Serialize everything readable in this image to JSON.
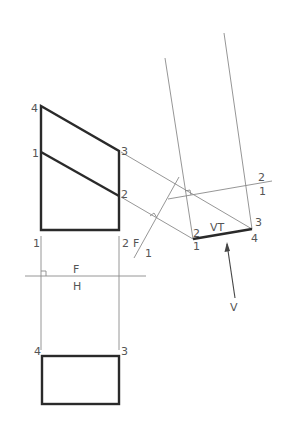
{
  "figure": {
    "type": "descriptive-geometry auxiliary view",
    "colors": {
      "object_line": "#2a2a2a",
      "construction_line": "#8a8a8a",
      "label": "#555555"
    }
  },
  "front_view": {
    "points": {
      "4": "4",
      "3": "3",
      "1": "1",
      "2": "2"
    },
    "bottom_labels": {
      "left": "1",
      "right": "2"
    }
  },
  "fold_lines": {
    "fh": {
      "upper": "F",
      "lower": "H"
    },
    "f1": {
      "left": "F",
      "right": "1"
    },
    "aux": {
      "upper": "2",
      "lower": "1"
    }
  },
  "top_view": {
    "points": {
      "left": "4",
      "right": "3"
    }
  },
  "auxiliary_view": {
    "edge_label": "VT",
    "points": {
      "p2": "2",
      "p1": "1",
      "p3": "3",
      "p4": "4"
    }
  },
  "view_direction": {
    "label": "V"
  }
}
